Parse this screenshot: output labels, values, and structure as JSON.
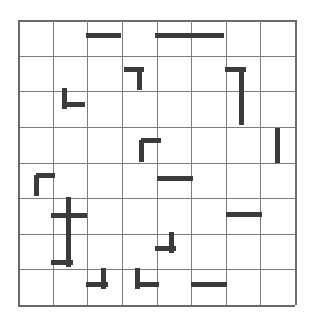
{
  "puzzle": {
    "title": "grid-wall-puzzle",
    "grid": {
      "columns": 8,
      "rows": 8,
      "cell_width": 34.6,
      "cell_height": 35.6,
      "origin_x": 18,
      "origin_y": 20,
      "width": 277,
      "height": 285,
      "line_color": "#7d7d7d",
      "border_color": "#6a6a6a",
      "background_color": "#ffffff"
    },
    "wall": {
      "color": "#3b3b3b",
      "thickness": 5,
      "count": 19
    },
    "segments": [
      {
        "name": "seg-r1-c3-horizontal",
        "orientation": "horizontal",
        "x": 86,
        "y": 35,
        "length": 35
      },
      {
        "name": "seg-r1-c5-horizontal",
        "orientation": "horizontal",
        "x": 155,
        "y": 35,
        "length": 69
      },
      {
        "name": "seg-r2-c4-corner-h",
        "orientation": "horizontal",
        "x": 124,
        "y": 69,
        "length": 20
      },
      {
        "name": "seg-r2-c4-corner-v",
        "orientation": "vertical",
        "x": 139,
        "y": 69,
        "length": 21
      },
      {
        "name": "seg-r2-c7-corner-h",
        "orientation": "horizontal",
        "x": 225,
        "y": 69,
        "length": 21
      },
      {
        "name": "seg-r2-c7-corner-v",
        "orientation": "vertical",
        "x": 241,
        "y": 69,
        "length": 56
      },
      {
        "name": "seg-r3-c2-corner-v",
        "orientation": "vertical",
        "x": 64,
        "y": 88,
        "length": 21
      },
      {
        "name": "seg-r3-c2-corner-h",
        "orientation": "horizontal",
        "x": 64,
        "y": 104,
        "length": 21
      },
      {
        "name": "seg-r4-c4-corner-v",
        "orientation": "vertical",
        "x": 141,
        "y": 140,
        "length": 22
      },
      {
        "name": "seg-r4-c4-corner-h",
        "orientation": "horizontal",
        "x": 141,
        "y": 140,
        "length": 20
      },
      {
        "name": "seg-r4-c8-vertical",
        "orientation": "vertical",
        "x": 277,
        "y": 128,
        "length": 35
      },
      {
        "name": "seg-r5-c1-corner-v",
        "orientation": "vertical",
        "x": 36,
        "y": 175,
        "length": 21
      },
      {
        "name": "seg-r5-c1-corner-h",
        "orientation": "horizontal",
        "x": 36,
        "y": 175,
        "length": 19
      },
      {
        "name": "seg-r5-c5-horizontal",
        "orientation": "horizontal",
        "x": 157,
        "y": 178,
        "length": 36
      },
      {
        "name": "seg-r6-c2-cross-v",
        "orientation": "vertical",
        "x": 68,
        "y": 197,
        "length": 70
      },
      {
        "name": "seg-r6-c2-cross-h",
        "orientation": "horizontal",
        "x": 51,
        "y": 215,
        "length": 36
      },
      {
        "name": "seg-r7-c2-foot-h",
        "orientation": "horizontal",
        "x": 51,
        "y": 262,
        "length": 22
      },
      {
        "name": "seg-r6-c7-horizontal",
        "orientation": "horizontal",
        "x": 226,
        "y": 214,
        "length": 36
      },
      {
        "name": "seg-r7-c5-corner-v",
        "orientation": "vertical",
        "x": 171,
        "y": 232,
        "length": 21
      },
      {
        "name": "seg-r7-c5-corner-h",
        "orientation": "horizontal",
        "x": 155,
        "y": 248,
        "length": 21
      },
      {
        "name": "seg-r8-c3-corner-v",
        "orientation": "vertical",
        "x": 103,
        "y": 268,
        "length": 21
      },
      {
        "name": "seg-r8-c3-corner-h",
        "orientation": "horizontal",
        "x": 86,
        "y": 284,
        "length": 22
      },
      {
        "name": "seg-r8-c4-corner-v",
        "orientation": "vertical",
        "x": 137,
        "y": 268,
        "length": 21
      },
      {
        "name": "seg-r8-c4-corner-h",
        "orientation": "horizontal",
        "x": 137,
        "y": 284,
        "length": 22
      },
      {
        "name": "seg-r8-c6-horizontal",
        "orientation": "horizontal",
        "x": 191,
        "y": 284,
        "length": 36
      }
    ],
    "grid_lines": {
      "horizontal_offsets": [
        0,
        35.6,
        71.3,
        106.9,
        142.5,
        178.1,
        213.8,
        249.4,
        285
      ],
      "vertical_offsets": [
        0,
        34.6,
        69.3,
        103.9,
        138.5,
        173.1,
        207.8,
        242.4,
        277
      ]
    }
  }
}
